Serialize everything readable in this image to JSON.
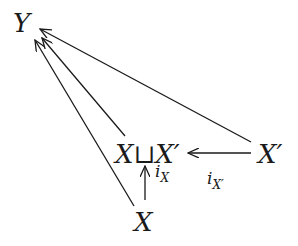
{
  "diagram": {
    "type": "commutative-diagram",
    "nodes": {
      "Y": "Y",
      "coproduct": {
        "left": "X",
        "symbol": "⊔",
        "right": "X′"
      },
      "Xprime": "X′",
      "X": "X"
    },
    "arrows": [
      {
        "from": "X",
        "to": "coproduct",
        "label_main": "i",
        "label_sub": "X"
      },
      {
        "from": "Xprime",
        "to": "coproduct",
        "label_main": "i",
        "label_sub": "X′"
      },
      {
        "from": "X",
        "to": "Y",
        "label_main": "",
        "label_sub": ""
      },
      {
        "from": "coproduct",
        "to": "Y",
        "label_main": "",
        "label_sub": ""
      },
      {
        "from": "Xprime",
        "to": "Y",
        "label_main": "",
        "label_sub": ""
      }
    ],
    "colors": {
      "ink": "#1a1a1a",
      "background": "#ffffff"
    }
  }
}
